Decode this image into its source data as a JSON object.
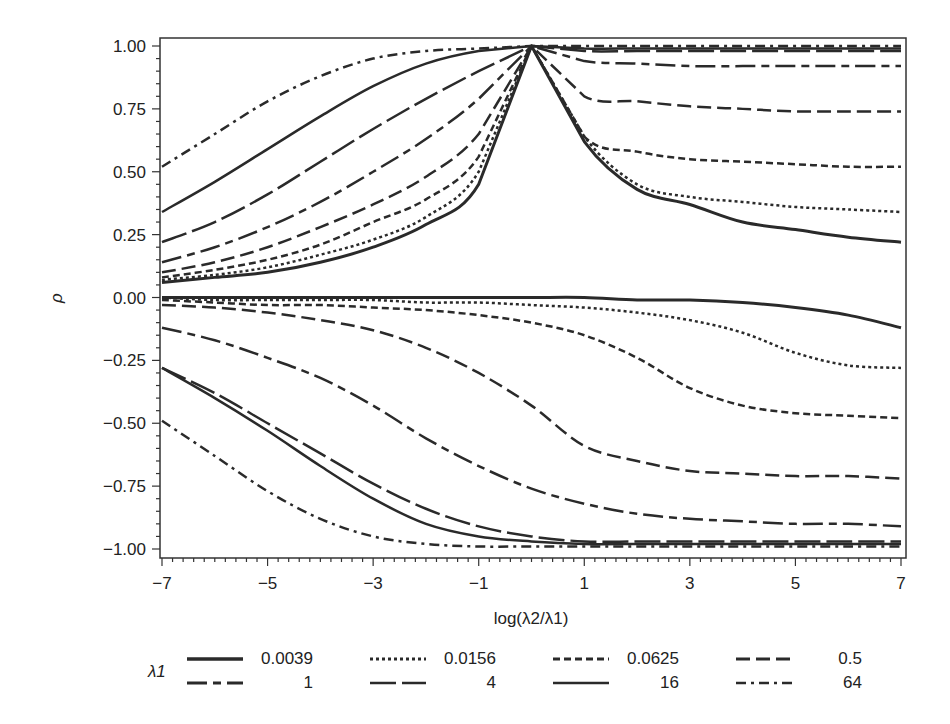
{
  "chart_data": {
    "type": "line",
    "title": "",
    "xlabel": "log(λ2/λ1)",
    "ylabel": "ρ",
    "xlim": [
      -7,
      7
    ],
    "ylim": [
      -1.0,
      1.0
    ],
    "grid": false,
    "legend_position": "bottom",
    "legend_title": "λ1",
    "x_ticks": [
      "-7",
      "-5",
      "-3",
      "-1",
      "1",
      "3",
      "5",
      "7"
    ],
    "y_ticks": [
      "1.00",
      "0.75",
      "0.50",
      "0.25",
      "0.00",
      "-0.25",
      "-0.50",
      "-0.75",
      "-1.00"
    ],
    "x": [
      -7,
      -6,
      -5,
      -4,
      -3,
      -2,
      -1,
      0,
      1,
      2,
      3,
      4,
      5,
      6,
      7
    ],
    "series": [
      {
        "name": "0.0039",
        "style": "solid-thick",
        "dash": "",
        "branch": "upper",
        "values": [
          0.06,
          0.08,
          0.1,
          0.14,
          0.2,
          0.29,
          0.45,
          1.0,
          0.62,
          0.43,
          0.37,
          0.3,
          0.27,
          0.24,
          0.22
        ]
      },
      {
        "name": "0.0156",
        "style": "dotted",
        "dash": "3 3",
        "branch": "upper",
        "values": [
          0.07,
          0.09,
          0.12,
          0.17,
          0.23,
          0.32,
          0.5,
          1.0,
          0.64,
          0.45,
          0.4,
          0.38,
          0.36,
          0.35,
          0.34
        ]
      },
      {
        "name": "0.0625",
        "style": "short-dash",
        "dash": "7 4",
        "branch": "upper",
        "values": [
          0.08,
          0.11,
          0.15,
          0.21,
          0.3,
          0.39,
          0.56,
          1.0,
          0.64,
          0.58,
          0.55,
          0.54,
          0.53,
          0.52,
          0.52
        ]
      },
      {
        "name": "0.5",
        "style": "dash",
        "dash": "14 6",
        "branch": "upper",
        "values": [
          0.1,
          0.14,
          0.2,
          0.28,
          0.37,
          0.48,
          0.65,
          1.0,
          0.8,
          0.78,
          0.76,
          0.75,
          0.74,
          0.74,
          0.74
        ]
      },
      {
        "name": "1",
        "style": "long-dash-short-dash",
        "dash": "20 6 8 6",
        "branch": "upper",
        "values": [
          0.14,
          0.2,
          0.28,
          0.38,
          0.5,
          0.63,
          0.79,
          1.0,
          0.94,
          0.93,
          0.92,
          0.92,
          0.92,
          0.92,
          0.92
        ]
      },
      {
        "name": "4",
        "style": "long-dash",
        "dash": "26 6",
        "branch": "upper",
        "values": [
          0.22,
          0.3,
          0.41,
          0.54,
          0.67,
          0.79,
          0.9,
          1.0,
          0.98,
          0.98,
          0.98,
          0.98,
          0.98,
          0.98,
          0.98
        ]
      },
      {
        "name": "16",
        "style": "solid",
        "dash": "",
        "branch": "upper",
        "values": [
          0.34,
          0.46,
          0.59,
          0.72,
          0.84,
          0.93,
          0.98,
          1.0,
          0.99,
          0.99,
          0.99,
          0.99,
          0.99,
          0.99,
          0.99
        ]
      },
      {
        "name": "64",
        "style": "dash-dot",
        "dash": "10 5 3 5",
        "branch": "upper",
        "values": [
          0.52,
          0.65,
          0.78,
          0.88,
          0.95,
          0.98,
          0.99,
          1.0,
          1.0,
          1.0,
          1.0,
          1.0,
          1.0,
          1.0,
          1.0
        ]
      },
      {
        "name": "0.0039",
        "style": "solid-thick",
        "dash": "",
        "branch": "lower",
        "values": [
          0.0,
          0.0,
          0.0,
          0.0,
          0.0,
          0.0,
          0.0,
          0.0,
          0.0,
          -0.01,
          -0.01,
          -0.02,
          -0.04,
          -0.07,
          -0.12
        ]
      },
      {
        "name": "0.0156",
        "style": "dotted",
        "dash": "3 3",
        "branch": "lower",
        "values": [
          0.0,
          -0.01,
          -0.01,
          -0.01,
          -0.01,
          -0.02,
          -0.02,
          -0.03,
          -0.04,
          -0.06,
          -0.09,
          -0.14,
          -0.22,
          -0.27,
          -0.28
        ]
      },
      {
        "name": "0.0625",
        "style": "short-dash",
        "dash": "7 4",
        "branch": "lower",
        "values": [
          -0.01,
          -0.02,
          -0.03,
          -0.03,
          -0.04,
          -0.05,
          -0.07,
          -0.1,
          -0.15,
          -0.24,
          -0.36,
          -0.43,
          -0.46,
          -0.47,
          -0.48
        ]
      },
      {
        "name": "0.5",
        "style": "dash",
        "dash": "14 6",
        "branch": "lower",
        "values": [
          -0.03,
          -0.04,
          -0.06,
          -0.09,
          -0.13,
          -0.2,
          -0.3,
          -0.43,
          -0.59,
          -0.65,
          -0.69,
          -0.7,
          -0.71,
          -0.71,
          -0.72
        ]
      },
      {
        "name": "1",
        "style": "long-dash-short-dash",
        "dash": "20 6 8 6",
        "branch": "lower",
        "values": [
          -0.12,
          -0.17,
          -0.24,
          -0.32,
          -0.43,
          -0.56,
          -0.67,
          -0.76,
          -0.82,
          -0.86,
          -0.88,
          -0.89,
          -0.9,
          -0.9,
          -0.91
        ]
      },
      {
        "name": "4",
        "style": "long-dash",
        "dash": "26 6",
        "branch": "lower",
        "values": [
          -0.28,
          -0.38,
          -0.5,
          -0.62,
          -0.74,
          -0.84,
          -0.91,
          -0.95,
          -0.97,
          -0.97,
          -0.97,
          -0.97,
          -0.97,
          -0.97,
          -0.97
        ]
      },
      {
        "name": "16",
        "style": "solid",
        "dash": "",
        "branch": "lower",
        "values": [
          -0.28,
          -0.4,
          -0.53,
          -0.67,
          -0.8,
          -0.9,
          -0.95,
          -0.97,
          -0.98,
          -0.98,
          -0.98,
          -0.98,
          -0.98,
          -0.98,
          -0.98
        ]
      },
      {
        "name": "64",
        "style": "dash-dot",
        "dash": "10 5 3 5",
        "branch": "lower",
        "values": [
          -0.49,
          -0.63,
          -0.77,
          -0.88,
          -0.95,
          -0.98,
          -0.99,
          -0.99,
          -0.99,
          -0.99,
          -0.99,
          -0.99,
          -0.99,
          -0.99,
          -0.99
        ]
      }
    ],
    "legend": [
      {
        "label": "0.0039",
        "dash": "",
        "width": 3.5
      },
      {
        "label": "0.0156",
        "dash": "3 3",
        "width": 3
      },
      {
        "label": "0.0625",
        "dash": "7 4",
        "width": 3
      },
      {
        "label": "0.5",
        "dash": "14 6",
        "width": 3
      },
      {
        "label": "1",
        "dash": "20 6 8 6",
        "width": 3
      },
      {
        "label": "4",
        "dash": "26 6",
        "width": 2.5
      },
      {
        "label": "16",
        "dash": "",
        "width": 2.5
      },
      {
        "label": "64",
        "dash": "10 5 3 5",
        "width": 2.5
      }
    ]
  },
  "colors": {
    "line": "#2a2a2a",
    "axis": "#333333",
    "background": "#ffffff"
  }
}
